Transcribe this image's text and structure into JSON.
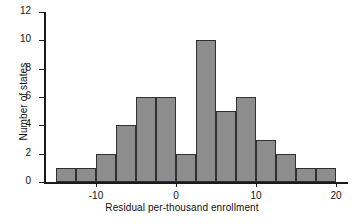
{
  "chart_data": {
    "type": "bar",
    "title": "",
    "subtitle": "",
    "xlabel": "Residual per-thousand enrollment",
    "ylabel": "Number of states",
    "bin_width": 2.5,
    "bin_starts": [
      -15,
      -12.5,
      -10,
      -7.5,
      -5,
      -2.5,
      0,
      2.5,
      5,
      7.5,
      10,
      12.5,
      15,
      17.5
    ],
    "categories": [
      "-15 to -12.5",
      "-12.5 to -10",
      "-10 to -7.5",
      "-7.5 to -5",
      "-5 to -2.5",
      "-2.5 to 0",
      "0 to 2.5",
      "2.5 to 5",
      "5 to 7.5",
      "7.5 to 10",
      "10 to 12.5",
      "12.5 to 15",
      "15 to 17.5",
      "17.5 to 20"
    ],
    "values": [
      1,
      1,
      2,
      4,
      6,
      6,
      2,
      10,
      5,
      6,
      3,
      2,
      1,
      0
    ],
    "extra_bar": {
      "bin_start": 17.5,
      "value": 1
    },
    "xlim": [
      -16.5,
      21.5
    ],
    "ylim": [
      0,
      12
    ],
    "xticks": [
      -10,
      0,
      10,
      20
    ],
    "xtick_labels": [
      "-10",
      "0",
      "10",
      "20"
    ],
    "yticks": [
      0,
      2,
      4,
      6,
      8,
      10,
      12
    ],
    "ytick_labels": [
      "0",
      "2",
      "4",
      "6",
      "8",
      "10",
      "12"
    ],
    "grid": false,
    "legend": null,
    "bar_color": "#8d8d8d",
    "bar_edge_color": "#303030",
    "axis_color": "#1a1a1a"
  }
}
